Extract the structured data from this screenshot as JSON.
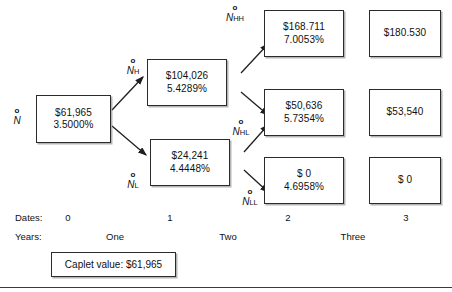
{
  "figure": {
    "type": "binomial-tree-diagram"
  },
  "nodes": [
    {
      "id": "n0",
      "label_symbol": "N",
      "label_subscript": "",
      "label_naught": "o",
      "value": "$61,965",
      "rate": "3.5000%",
      "date": "0"
    },
    {
      "id": "nH",
      "label_symbol": "N",
      "label_subscript": "H",
      "label_naught": "o",
      "value": "$104,026",
      "rate": "5.4289%",
      "date": "1"
    },
    {
      "id": "nL",
      "label_symbol": "N",
      "label_subscript": "L",
      "label_naught": "o",
      "value": "$24,241",
      "rate": "4.4448%",
      "date": "1"
    },
    {
      "id": "nHH",
      "label_symbol": "N",
      "label_subscript": "HH",
      "label_naught": "o",
      "value": "$168.711",
      "rate": "7.0053%",
      "date": "2"
    },
    {
      "id": "nHL",
      "label_symbol": "N",
      "label_subscript": "HL",
      "label_naught": "o",
      "value": "$50,636",
      "rate": "5.7354%",
      "date": "2"
    },
    {
      "id": "nLL",
      "label_symbol": "N",
      "label_subscript": "LL",
      "label_naught": "o",
      "value": "$ 0",
      "rate": "4.6958%",
      "date": "2"
    },
    {
      "id": "t3a",
      "value": "$180.530",
      "rate": "",
      "date": "3"
    },
    {
      "id": "t3b",
      "value": "$53,540",
      "rate": "",
      "date": "3"
    },
    {
      "id": "t3c",
      "value": "$ 0",
      "rate": "",
      "date": "3"
    }
  ],
  "axis": {
    "dates_label": "Dates:",
    "years_label": "Years:",
    "dates": [
      "0",
      "1",
      "2",
      "3"
    ],
    "years": [
      "One",
      "Two",
      "Three"
    ]
  },
  "caplet": {
    "text": "Caplet value: $61,965"
  },
  "colors": {
    "stroke": "#2b2b2b",
    "text": "#111111",
    "background": "#ffffff"
  }
}
